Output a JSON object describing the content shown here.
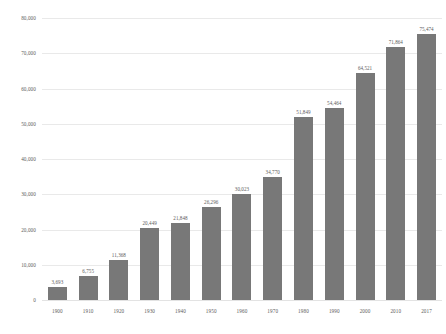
{
  "chart_data": {
    "type": "bar",
    "title": "",
    "subtitle": "",
    "xlabel": "",
    "ylabel": "",
    "categories": [
      "1900",
      "1910",
      "1920",
      "1930",
      "1940",
      "1950",
      "1960",
      "1970",
      "1980",
      "1990",
      "2000",
      "2010",
      "2017"
    ],
    "values": [
      3693,
      6755,
      11368,
      20449,
      21848,
      26296,
      30023,
      34770,
      51849,
      54464,
      64521,
      71864,
      75474
    ],
    "value_labels": [
      "3,693",
      "6,755",
      "11,368",
      "20,449",
      "21,848",
      "26,296",
      "30,023",
      "34,770",
      "51,849",
      "54,464",
      "64,521",
      "71,864",
      "75,474"
    ],
    "ylim": [
      0,
      80000
    ],
    "y_ticks": [
      0,
      10000,
      20000,
      30000,
      40000,
      50000,
      60000,
      70000,
      80000
    ],
    "y_tick_labels": [
      "0",
      "10,000",
      "20,000",
      "30,000",
      "40,000",
      "50,000",
      "60,000",
      "70,000",
      "80,000"
    ],
    "grid": true,
    "legend": "none",
    "series": [
      {
        "name": "",
        "values": [
          3693,
          6755,
          11368,
          20449,
          21848,
          26296,
          30023,
          34770,
          51849,
          54464,
          64521,
          71864,
          75474
        ]
      }
    ],
    "colors": {
      "bar": "#787878",
      "gridline": "#e9e9e9",
      "text": "#5a5a5a",
      "background": "#ffffff"
    }
  }
}
